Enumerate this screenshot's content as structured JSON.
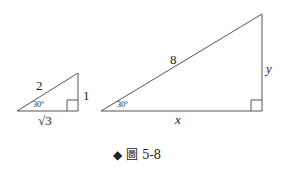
{
  "figure": {
    "caption_marker": "◆",
    "caption": "圖 5-8",
    "small_triangle": {
      "hypotenuse": "2",
      "opposite": "1",
      "adjacent": "√3",
      "angle": "30°"
    },
    "large_triangle": {
      "hypotenuse": "8",
      "opposite": "y",
      "adjacent": "x",
      "angle": "30°"
    },
    "colors": {
      "line": "#555555",
      "marker": "#222222"
    }
  }
}
